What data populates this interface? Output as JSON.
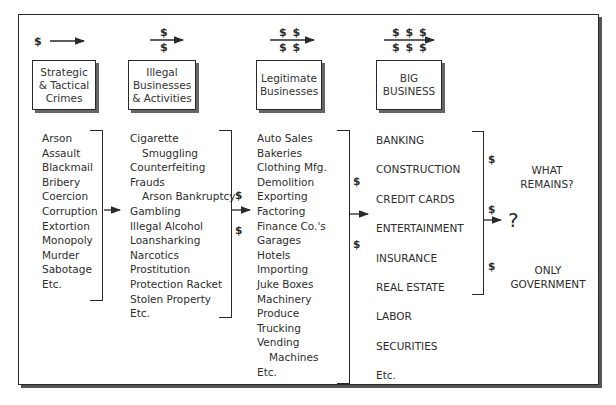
{
  "stages": [
    {
      "label_lines": [
        "Strategic",
        "& Tactical",
        "Crimes"
      ],
      "money_top": "$",
      "money_bottom": ""
    },
    {
      "label_lines": [
        "Illegal",
        "Businesses",
        "& Activities"
      ],
      "money_top": "$",
      "money_bottom": "$"
    },
    {
      "label_lines": [
        "Legitimate",
        "Businesses"
      ],
      "money_top": "$ $",
      "money_bottom": "$ $"
    },
    {
      "label_lines": [
        "BIG",
        "BUSINESS"
      ],
      "money_top": "$ $ $",
      "money_bottom": "$ $ $"
    }
  ],
  "lists": {
    "crimes": [
      "Arson",
      "Assault",
      "Blackmail",
      "Bribery",
      "Coercion",
      "Corruption",
      "Extortion",
      "Monopoly",
      "Murder",
      "Sabotage",
      "Etc."
    ],
    "illegal": [
      {
        "text": "Cigarette",
        "indent": false
      },
      {
        "text": "Smuggling",
        "indent": true
      },
      {
        "text": "Counterfeiting",
        "indent": false
      },
      {
        "text": "Frauds",
        "indent": false
      },
      {
        "text": "Arson Bankruptcy",
        "indent": true
      },
      {
        "text": "Gambling",
        "indent": false
      },
      {
        "text": "Illegal Alcohol",
        "indent": false
      },
      {
        "text": "Loansharking",
        "indent": false
      },
      {
        "text": "Narcotics",
        "indent": false
      },
      {
        "text": "Prostitution",
        "indent": false
      },
      {
        "text": "Protection Racket",
        "indent": false
      },
      {
        "text": "Stolen Property",
        "indent": false
      },
      {
        "text": "Etc.",
        "indent": false
      }
    ],
    "legitimate": [
      {
        "text": "Auto Sales",
        "indent": false
      },
      {
        "text": "Bakeries",
        "indent": false
      },
      {
        "text": "Clothing Mfg.",
        "indent": false
      },
      {
        "text": "Demolition",
        "indent": false
      },
      {
        "text": "Exporting",
        "indent": false
      },
      {
        "text": "Factoring",
        "indent": false
      },
      {
        "text": "Finance Co.'s",
        "indent": false
      },
      {
        "text": "Garages",
        "indent": false
      },
      {
        "text": "Hotels",
        "indent": false
      },
      {
        "text": "Importing",
        "indent": false
      },
      {
        "text": "Juke Boxes",
        "indent": false
      },
      {
        "text": "Machinery",
        "indent": false
      },
      {
        "text": "Produce",
        "indent": false
      },
      {
        "text": "Trucking",
        "indent": false
      },
      {
        "text": "Vending",
        "indent": false
      },
      {
        "text": "Machines",
        "indent": true
      },
      {
        "text": "Etc.",
        "indent": false
      }
    ],
    "big_business": [
      "BANKING",
      "CONSTRUCTION",
      "CREDIT CARDS",
      "ENTERTAINMENT",
      "INSURANCE",
      "REAL ESTATE",
      "LABOR",
      "SECURITIES",
      "Etc."
    ]
  },
  "flow_dollars": {
    "illegal_to_legit": [
      "$",
      "$"
    ],
    "legit_to_big": [
      "$",
      "$"
    ],
    "big_to_outcome": [
      "$",
      "$",
      "$"
    ]
  },
  "outcome": {
    "what_remains": [
      "WHAT",
      "REMAINS?"
    ],
    "question": "?",
    "only_government": [
      "ONLY",
      "GOVERNMENT"
    ]
  }
}
